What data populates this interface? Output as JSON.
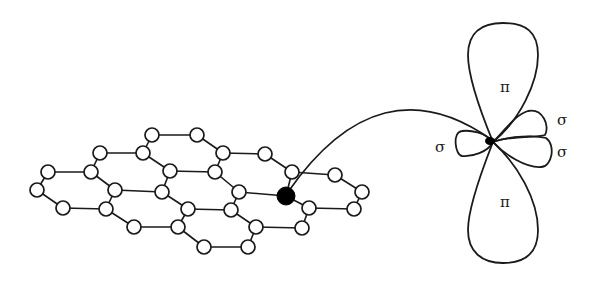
{
  "diagram": {
    "colors": {
      "line": "#1a1a1a",
      "atom_fill": "#ffffff",
      "highlight": "#000000",
      "background": "#ffffff"
    },
    "lattice": {
      "atom_radius": 7,
      "highlight_radius": 9,
      "atoms": [
        [
          152,
          135
        ],
        [
          197,
          135
        ],
        [
          100,
          153
        ],
        [
          143,
          153
        ],
        [
          223,
          153
        ],
        [
          265,
          154
        ],
        [
          48,
          172
        ],
        [
          91,
          172
        ],
        [
          170,
          171
        ],
        [
          215,
          172
        ],
        [
          292,
          172
        ],
        [
          335,
          175
        ],
        [
          37,
          190
        ],
        [
          115,
          190
        ],
        [
          162,
          192
        ],
        [
          239,
          192
        ],
        [
          362,
          192
        ],
        [
          63,
          208
        ],
        [
          106,
          209
        ],
        [
          188,
          209
        ],
        [
          231,
          210
        ],
        [
          309,
          208
        ],
        [
          354,
          209
        ],
        [
          134,
          227
        ],
        [
          178,
          227
        ],
        [
          256,
          227
        ],
        [
          302,
          228
        ],
        [
          204,
          247
        ],
        [
          248,
          247
        ]
      ],
      "highlighted_atom": [
        286,
        196
      ],
      "bonds": [
        [
          [
            152,
            135
          ],
          [
            197,
            135
          ]
        ],
        [
          [
            100,
            153
          ],
          [
            143,
            153
          ]
        ],
        [
          [
            223,
            153
          ],
          [
            265,
            154
          ]
        ],
        [
          [
            48,
            172
          ],
          [
            91,
            172
          ]
        ],
        [
          [
            170,
            171
          ],
          [
            215,
            172
          ]
        ],
        [
          [
            292,
            172
          ],
          [
            335,
            175
          ]
        ],
        [
          [
            115,
            190
          ],
          [
            162,
            192
          ]
        ],
        [
          [
            239,
            192
          ],
          [
            286,
            196
          ]
        ],
        [
          [
            63,
            208
          ],
          [
            106,
            209
          ]
        ],
        [
          [
            188,
            209
          ],
          [
            231,
            210
          ]
        ],
        [
          [
            309,
            208
          ],
          [
            354,
            209
          ]
        ],
        [
          [
            134,
            227
          ],
          [
            178,
            227
          ]
        ],
        [
          [
            256,
            227
          ],
          [
            302,
            228
          ]
        ],
        [
          [
            204,
            247
          ],
          [
            248,
            247
          ]
        ],
        [
          [
            152,
            135
          ],
          [
            143,
            153
          ]
        ],
        [
          [
            197,
            135
          ],
          [
            223,
            153
          ]
        ],
        [
          [
            100,
            153
          ],
          [
            91,
            172
          ]
        ],
        [
          [
            143,
            153
          ],
          [
            170,
            171
          ]
        ],
        [
          [
            223,
            153
          ],
          [
            215,
            172
          ]
        ],
        [
          [
            265,
            154
          ],
          [
            292,
            172
          ]
        ],
        [
          [
            48,
            172
          ],
          [
            37,
            190
          ]
        ],
        [
          [
            91,
            172
          ],
          [
            115,
            190
          ]
        ],
        [
          [
            170,
            171
          ],
          [
            162,
            192
          ]
        ],
        [
          [
            215,
            172
          ],
          [
            239,
            192
          ]
        ],
        [
          [
            292,
            172
          ],
          [
            286,
            196
          ]
        ],
        [
          [
            335,
            175
          ],
          [
            362,
            192
          ]
        ],
        [
          [
            37,
            190
          ],
          [
            63,
            208
          ]
        ],
        [
          [
            115,
            190
          ],
          [
            106,
            209
          ]
        ],
        [
          [
            162,
            192
          ],
          [
            188,
            209
          ]
        ],
        [
          [
            239,
            192
          ],
          [
            231,
            210
          ]
        ],
        [
          [
            286,
            196
          ],
          [
            309,
            208
          ]
        ],
        [
          [
            362,
            192
          ],
          [
            354,
            209
          ]
        ],
        [
          [
            106,
            209
          ],
          [
            134,
            227
          ]
        ],
        [
          [
            188,
            209
          ],
          [
            178,
            227
          ]
        ],
        [
          [
            231,
            210
          ],
          [
            256,
            227
          ]
        ],
        [
          [
            309,
            208
          ],
          [
            302,
            228
          ]
        ],
        [
          [
            178,
            227
          ],
          [
            204,
            247
          ]
        ],
        [
          [
            256,
            227
          ],
          [
            248,
            247
          ]
        ]
      ]
    },
    "connector": {
      "from": [
        288,
        192
      ],
      "control": [
        380,
        60
      ],
      "to": [
        492,
        140
      ]
    },
    "orbital": {
      "center": [
        493,
        142
      ],
      "labels": [
        {
          "id": "pi-top",
          "text": "π",
          "x": 505,
          "y": 88
        },
        {
          "id": "pi-bottom",
          "text": "π",
          "x": 505,
          "y": 203
        },
        {
          "id": "sigma-left",
          "text": "σ",
          "x": 440,
          "y": 148
        },
        {
          "id": "sigma-right-upper",
          "text": "σ",
          "x": 562,
          "y": 121
        },
        {
          "id": "sigma-right-lower",
          "text": "σ",
          "x": 562,
          "y": 153
        }
      ]
    }
  }
}
